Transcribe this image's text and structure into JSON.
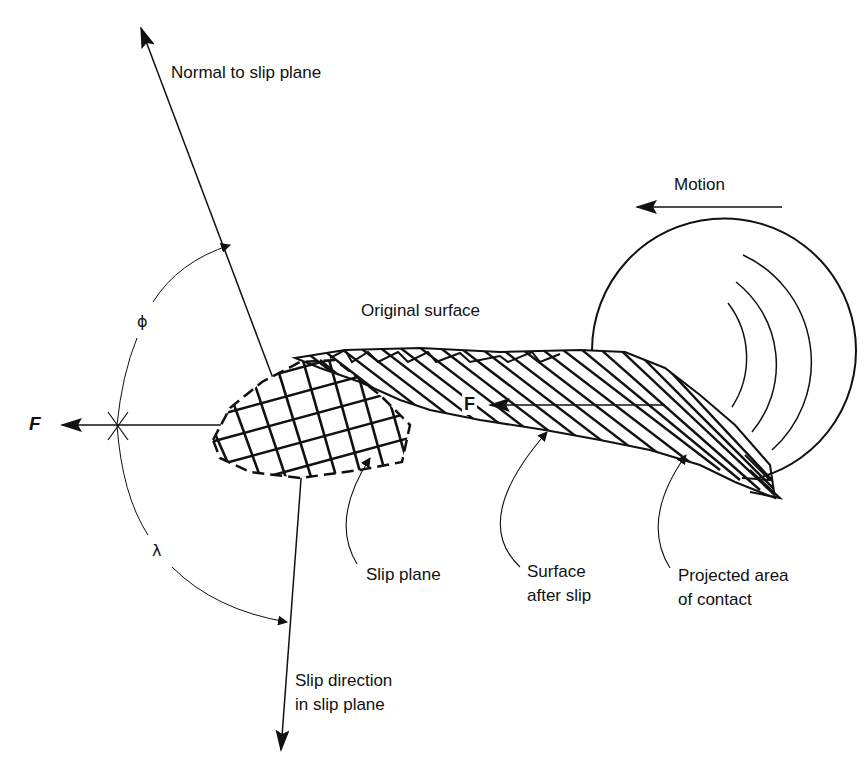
{
  "figure": {
    "labels": {
      "normal": "Normal to slip plane",
      "motion": "Motion",
      "original_surface": "Original surface",
      "phi": "ϕ",
      "lambda": "λ",
      "force_external": "F",
      "force_contact": "F",
      "slip_plane": "Slip plane",
      "surface_after_slip_1": "Surface",
      "surface_after_slip_2": "after slip",
      "projected_area_1": "Projected area",
      "projected_area_2": "of contact",
      "slip_direction_1": "Slip direction",
      "slip_direction_2": "in slip plane"
    },
    "colors": {
      "ink": "#111111",
      "background": "#ffffff"
    }
  }
}
